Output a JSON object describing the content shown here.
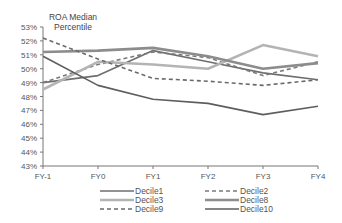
{
  "chart_data": {
    "type": "line",
    "title": "ROA Median Percentile",
    "title_lines": [
      "ROA Median",
      "Percentile"
    ],
    "xlabel": "",
    "ylabel": "ROA Median Percentile",
    "categories": [
      "FY-1",
      "FY0",
      "FY1",
      "FY2",
      "FY3",
      "FY4"
    ],
    "ylim": [
      43,
      53
    ],
    "yticks": [
      "43%",
      "44%",
      "45%",
      "46%",
      "47%",
      "48%",
      "49%",
      "50%",
      "51%",
      "52%",
      "53%"
    ],
    "grid": false,
    "legend_position": "bottom",
    "series": [
      {
        "name": "Decile1",
        "values": [
          49.0,
          49.5,
          51.3,
          50.5,
          49.7,
          49.2
        ],
        "color": "#6e6e6e",
        "width": 1.6,
        "dash": ""
      },
      {
        "name": "Decile2",
        "values": [
          49.0,
          50.3,
          51.2,
          50.8,
          49.5,
          50.5
        ],
        "color": "#7a7a7a",
        "width": 1.6,
        "dash": "4,3"
      },
      {
        "name": "Decile3",
        "values": [
          48.5,
          50.5,
          50.3,
          50.0,
          51.7,
          50.9
        ],
        "color": "#b4b4b4",
        "width": 2.6,
        "dash": ""
      },
      {
        "name": "Decile8",
        "values": [
          51.2,
          51.3,
          51.5,
          50.9,
          50.0,
          50.4
        ],
        "color": "#8c8c8c",
        "width": 2.6,
        "dash": ""
      },
      {
        "name": "Decile9",
        "values": [
          52.2,
          50.7,
          49.3,
          49.1,
          48.8,
          49.2
        ],
        "color": "#6a6a6a",
        "width": 1.6,
        "dash": "4,3"
      },
      {
        "name": "Decile10",
        "values": [
          50.9,
          48.8,
          47.8,
          47.5,
          46.7,
          47.3
        ],
        "color": "#5e5e5e",
        "width": 1.6,
        "dash": ""
      }
    ],
    "legend": [
      {
        "name": "Decile1",
        "col": 0,
        "row": 0
      },
      {
        "name": "Decile2",
        "col": 1,
        "row": 0
      },
      {
        "name": "Decile3",
        "col": 0,
        "row": 1
      },
      {
        "name": "Decile8",
        "col": 1,
        "row": 1
      },
      {
        "name": "Decile9",
        "col": 0,
        "row": 2
      },
      {
        "name": "Decile10",
        "col": 1,
        "row": 2
      }
    ]
  }
}
